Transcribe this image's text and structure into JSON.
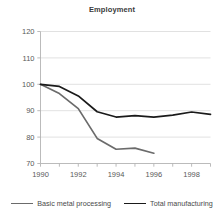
{
  "chart_data": {
    "type": "line",
    "title": "Employment",
    "xlabel": "",
    "ylabel": "",
    "xlim": [
      1990,
      1999
    ],
    "ylim": [
      70,
      120
    ],
    "yticks": [
      70,
      80,
      90,
      100,
      110,
      120
    ],
    "xticks": [
      1990,
      1992,
      1994,
      1996,
      1998
    ],
    "xtick_minor": [
      1991,
      1993,
      1995,
      1997,
      1999
    ],
    "grid": "horizontal",
    "legend_position": "bottom",
    "series": [
      {
        "name": "Basic metal processing",
        "color": "#6b6b6b",
        "x": [
          1990,
          1991,
          1992,
          1993,
          1994,
          1995,
          1996
        ],
        "values": [
          100.0,
          96.5,
          90.8,
          79.5,
          75.4,
          75.8,
          73.9
        ]
      },
      {
        "name": "Total manufacturing",
        "color": "#1a1a1a",
        "x": [
          1990,
          1991,
          1992,
          1993,
          1994,
          1995,
          1996,
          1997,
          1998,
          1999
        ],
        "values": [
          100.0,
          99.2,
          95.6,
          89.6,
          87.6,
          88.1,
          87.6,
          88.3,
          89.5,
          88.6
        ]
      }
    ],
    "ytick_labels": [
      "70",
      "80",
      "90",
      "100",
      "110",
      "120"
    ],
    "xtick_labels": [
      "1990",
      "1992",
      "1994",
      "1996",
      "1998"
    ]
  },
  "legend": {
    "items": [
      {
        "label": "Basic metal processing",
        "color": "#6b6b6b"
      },
      {
        "label": "Total manufacturing",
        "color": "#1a1a1a"
      }
    ]
  }
}
